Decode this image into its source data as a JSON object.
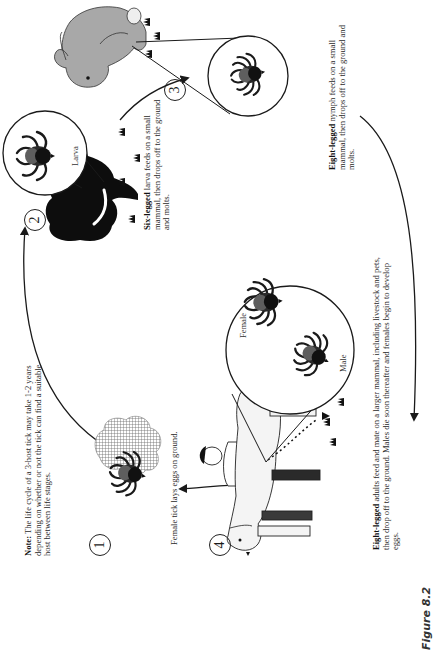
{
  "figure": {
    "label": "Figure 8.2",
    "title": "Life cycle of a 3-host tick"
  },
  "note": {
    "prefix": "Note:",
    "text": " The life cycle of a 3-host tick may take 1-2 years depending on whether or not the tick can find a suitable host between life stages."
  },
  "stages": [
    {
      "number": "1",
      "host": "ground",
      "caption_bold": "",
      "caption": "Female tick lays eggs on ground."
    },
    {
      "number": "2",
      "host": "small mammal (squirrel)",
      "inset_label": "Larva",
      "caption_bold": "Six-legged",
      "caption": " larva feeds on a small mammal, then drops off to the ground and molts."
    },
    {
      "number": "3",
      "host": "small mammal (rabbit)",
      "inset_label": "",
      "caption_bold": "Eight-legged",
      "caption": " nymph feeds on a small mammal, then drops off to the ground and molts."
    },
    {
      "number": "4",
      "host": "larger mammal (dog, human)",
      "inset_labels": [
        "Female",
        "Male"
      ],
      "caption_bold": "Eight-legged",
      "caption": " adults feed and mate on a larger mammal, including livestock and pets, then drop off to the ground. Males die soon thereafter and females begin to develop eggs."
    }
  ],
  "icons": {
    "tick": "tick-icon",
    "eggs": "egg-cluster-icon",
    "squirrel": "squirrel-icon",
    "rabbit": "rabbit-icon",
    "dog": "dog-icon",
    "person": "person-icon",
    "arrow": "cycle-arrow-icon",
    "grass": "grass-icon"
  },
  "colors": {
    "ink": "#1a1a1a",
    "tick_body": "#222222",
    "tick_scutum": "#5a5a5a",
    "rabbit": "#a8a8a8",
    "squirrel": "#0d0d0d",
    "dog": "#f4f4f4",
    "eggs": "#7a7a7a"
  }
}
